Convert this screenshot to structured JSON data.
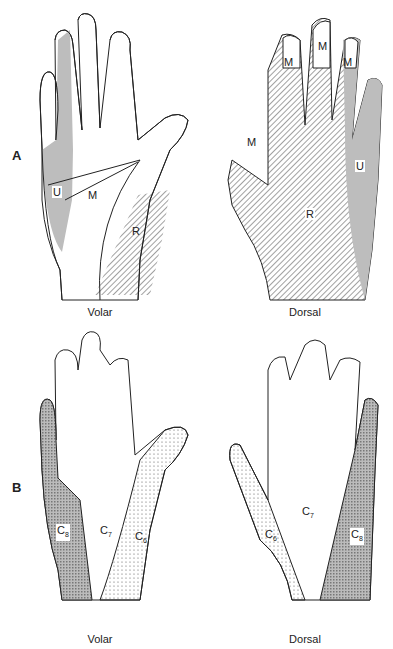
{
  "figure": {
    "panels": [
      {
        "letter": "A",
        "subject": "Peripheral nerve sensory distribution",
        "views": [
          {
            "caption": "Volar",
            "regions": [
              {
                "label": "U",
                "fill": "gray"
              },
              {
                "label": "M",
                "fill": "white"
              },
              {
                "label": "R",
                "fill": "hatched"
              }
            ]
          },
          {
            "caption": "Dorsal",
            "regions": [
              {
                "label": "M",
                "fill": "white",
                "count": 4
              },
              {
                "label": "R",
                "fill": "hatched"
              },
              {
                "label": "U",
                "fill": "gray"
              }
            ]
          }
        ]
      },
      {
        "letter": "B",
        "subject": "Dermatomal distribution",
        "views": [
          {
            "caption": "Volar",
            "regions": [
              {
                "label": "C",
                "sub": "8",
                "fill": "crosshatch"
              },
              {
                "label": "C",
                "sub": "7",
                "fill": "white"
              },
              {
                "label": "C",
                "sub": "6",
                "fill": "dotted"
              }
            ]
          },
          {
            "caption": "Dorsal",
            "regions": [
              {
                "label": "C",
                "sub": "6",
                "fill": "dotted"
              },
              {
                "label": "C",
                "sub": "7",
                "fill": "white"
              },
              {
                "label": "C",
                "sub": "8",
                "fill": "crosshatch"
              }
            ]
          }
        ]
      }
    ]
  },
  "labels": {
    "a": "A",
    "b": "B",
    "volar": "Volar",
    "dorsal": "Dorsal",
    "U": "U",
    "M": "M",
    "R": "R",
    "C": "C",
    "s6": "6",
    "s7": "7",
    "s8": "8"
  },
  "colors": {
    "gray": "#bdbdbd",
    "line": "#222222",
    "hatch": "#444444"
  }
}
